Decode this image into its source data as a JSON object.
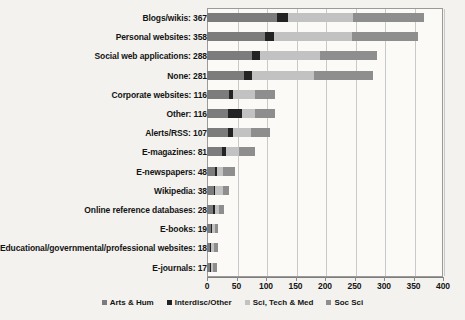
{
  "chart_data": {
    "type": "bar",
    "orientation": "horizontal",
    "stacked": true,
    "title": "",
    "xlabel": "",
    "ylabel": "",
    "xlim": [
      0,
      400
    ],
    "xticks": [
      0,
      50,
      100,
      150,
      200,
      250,
      300,
      350,
      400
    ],
    "grid": true,
    "legend_position": "bottom",
    "series": [
      {
        "name": "Arts & Hum",
        "color": "#7c7c7c",
        "values": [
          118,
          99,
          77,
          63,
          38,
          35,
          35,
          25,
          13,
          12,
          10,
          6,
          5,
          5
        ]
      },
      {
        "name": "Interdisc/Other",
        "color": "#232323",
        "values": [
          19,
          15,
          13,
          14,
          6,
          25,
          9,
          7,
          4,
          2,
          4,
          2,
          2,
          2
        ]
      },
      {
        "name": "Sci, Tech & Med",
        "color": "#c2c2c2",
        "values": [
          111,
          132,
          101,
          105,
          38,
          22,
          31,
          23,
          11,
          13,
          6,
          5,
          5,
          4
        ]
      },
      {
        "name": "Soc Sci",
        "color": "#8e8e8e",
        "values": [
          119,
          112,
          97,
          99,
          34,
          34,
          32,
          26,
          20,
          11,
          8,
          6,
          6,
          6
        ]
      }
    ],
    "categories": [
      "Blogs/wikis",
      "Personal websites",
      "Social web applications",
      "None",
      "Corporate websites",
      "Other",
      "Alerts/RSS",
      "E-magazines",
      "E-newspapers",
      "Wikipedia",
      "Online reference databases",
      "E-books",
      "Educational/governmental/professional websites",
      "E-journals"
    ],
    "totals": [
      367,
      358,
      288,
      281,
      116,
      116,
      107,
      81,
      48,
      38,
      28,
      19,
      18,
      17
    ],
    "rows": [
      {
        "label": "Blogs/wikis: 367",
        "total": 367,
        "segments": [
          118,
          19,
          111,
          119
        ]
      },
      {
        "label": "Personal websites: 358",
        "total": 358,
        "segments": [
          99,
          15,
          132,
          112
        ]
      },
      {
        "label": "Social web applications: 288",
        "total": 288,
        "segments": [
          77,
          13,
          101,
          97
        ]
      },
      {
        "label": "None: 281",
        "total": 281,
        "segments": [
          63,
          14,
          105,
          99
        ]
      },
      {
        "label": "Corporate websites: 116",
        "total": 116,
        "segments": [
          38,
          6,
          38,
          34
        ]
      },
      {
        "label": "Other: 116",
        "total": 116,
        "segments": [
          35,
          25,
          22,
          34
        ]
      },
      {
        "label": "Alerts/RSS: 107",
        "total": 107,
        "segments": [
          35,
          9,
          31,
          32
        ]
      },
      {
        "label": "E-magazines: 81",
        "total": 81,
        "segments": [
          25,
          7,
          23,
          26
        ]
      },
      {
        "label": "E-newspapers: 48",
        "total": 48,
        "segments": [
          13,
          4,
          11,
          20
        ]
      },
      {
        "label": "Wikipedia: 38",
        "total": 38,
        "segments": [
          12,
          2,
          13,
          11
        ]
      },
      {
        "label": "Online reference databases: 28",
        "total": 28,
        "segments": [
          10,
          4,
          6,
          8
        ]
      },
      {
        "label": "E-books: 19",
        "total": 19,
        "segments": [
          6,
          2,
          5,
          6
        ]
      },
      {
        "label": "Educational/governmental/professional websites: 18",
        "total": 18,
        "segments": [
          5,
          2,
          5,
          6
        ]
      },
      {
        "label": "E-journals: 17",
        "total": 17,
        "segments": [
          5,
          2,
          4,
          6
        ]
      }
    ]
  },
  "axis": {
    "ticks": [
      "0",
      "50",
      "100",
      "150",
      "200",
      "250",
      "300",
      "350",
      "400"
    ]
  },
  "legend": {
    "items": [
      {
        "label": "Arts & Hum",
        "color": "#7c7c7c"
      },
      {
        "label": "Interdisc/Other",
        "color": "#232323"
      },
      {
        "label": "Sci, Tech & Med",
        "color": "#c2c2c2"
      },
      {
        "label": "Soc Sci",
        "color": "#8e8e8e"
      }
    ]
  }
}
